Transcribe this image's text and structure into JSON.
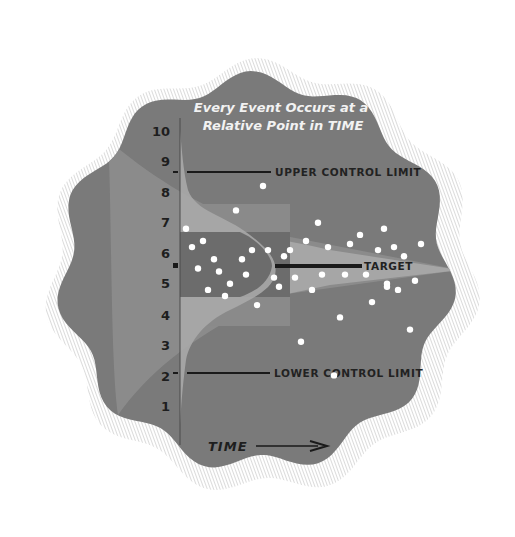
{
  "title": {
    "line1": "Every Event Occurs at a",
    "line2": "Relative Point in TIME"
  },
  "labels": {
    "upper": "UPPER CONTROL LIMIT",
    "target": "TARGET",
    "lower": "LOWER CONTROL LIMIT",
    "time": "TIME"
  },
  "axis": {
    "ticks": [
      "10",
      "9",
      "8",
      "7",
      "6",
      "5",
      "4",
      "3",
      "2",
      "1"
    ]
  },
  "colors": {
    "background": "#7a7a7a",
    "band_light": "#a8a8a8",
    "band_mid": "#8c8c8c",
    "band_dark": "#6a6a6a",
    "dot": "#ffffff",
    "line": "#1a1a1a"
  },
  "chart_data": {
    "type": "scatter",
    "title": "Every Event Occurs at a Relative Point in TIME",
    "xlabel": "TIME",
    "ylabel": "",
    "ylim": [
      0.5,
      10.5
    ],
    "yticks": [
      1,
      2,
      3,
      4,
      5,
      6,
      7,
      8,
      9,
      10
    ],
    "reference_lines": [
      {
        "name": "UPPER CONTROL LIMIT",
        "y": 8.8
      },
      {
        "name": "TARGET",
        "y": 5.6
      },
      {
        "name": "LOWER CONTROL LIMIT",
        "y": 2.4
      }
    ],
    "distribution": "normal curve centered on target, tapering funnel toward the right",
    "points": [
      {
        "x": 263,
        "y": 8.2
      },
      {
        "x": 236,
        "y": 7.4
      },
      {
        "x": 318,
        "y": 7.0
      },
      {
        "x": 186,
        "y": 6.8
      },
      {
        "x": 384,
        "y": 6.8
      },
      {
        "x": 203,
        "y": 6.4
      },
      {
        "x": 306,
        "y": 6.4
      },
      {
        "x": 360,
        "y": 6.6
      },
      {
        "x": 192,
        "y": 6.2
      },
      {
        "x": 252,
        "y": 6.1
      },
      {
        "x": 268,
        "y": 6.1
      },
      {
        "x": 290,
        "y": 6.1
      },
      {
        "x": 328,
        "y": 6.2
      },
      {
        "x": 350,
        "y": 6.3
      },
      {
        "x": 378,
        "y": 6.1
      },
      {
        "x": 394,
        "y": 6.2
      },
      {
        "x": 421,
        "y": 6.3
      },
      {
        "x": 214,
        "y": 5.8
      },
      {
        "x": 242,
        "y": 5.8
      },
      {
        "x": 284,
        "y": 5.9
      },
      {
        "x": 404,
        "y": 5.9
      },
      {
        "x": 198,
        "y": 5.5
      },
      {
        "x": 219,
        "y": 5.4
      },
      {
        "x": 246,
        "y": 5.3
      },
      {
        "x": 274,
        "y": 5.2
      },
      {
        "x": 295,
        "y": 5.2
      },
      {
        "x": 322,
        "y": 5.3
      },
      {
        "x": 345,
        "y": 5.3
      },
      {
        "x": 366,
        "y": 5.3
      },
      {
        "x": 387,
        "y": 5.0
      },
      {
        "x": 415,
        "y": 5.1
      },
      {
        "x": 230,
        "y": 5.0
      },
      {
        "x": 279,
        "y": 4.9
      },
      {
        "x": 312,
        "y": 4.8
      },
      {
        "x": 208,
        "y": 4.8
      },
      {
        "x": 225,
        "y": 4.6
      },
      {
        "x": 387,
        "y": 4.9
      },
      {
        "x": 398,
        "y": 4.8
      },
      {
        "x": 257,
        "y": 4.3
      },
      {
        "x": 372,
        "y": 4.4
      },
      {
        "x": 340,
        "y": 3.9
      },
      {
        "x": 410,
        "y": 3.5
      },
      {
        "x": 301,
        "y": 3.1
      },
      {
        "x": 334,
        "y": 2.0
      }
    ]
  }
}
